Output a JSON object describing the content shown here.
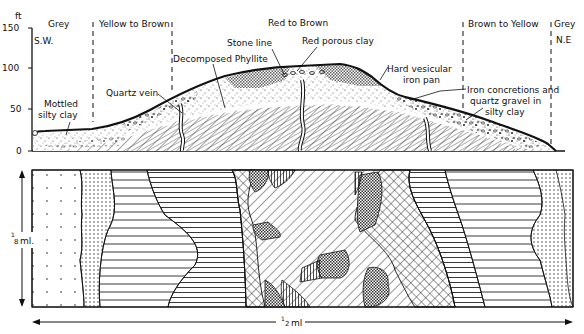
{
  "profile": {
    "y_axis": {
      "unit": "ft",
      "ticks": [
        "150",
        "100",
        "50",
        "0"
      ]
    },
    "zones": [
      {
        "label": "Grey"
      },
      {
        "label": "Yellow to Brown"
      },
      {
        "label": "Red to Brown"
      },
      {
        "label": "Brown to Yellow"
      },
      {
        "label": "Grey"
      }
    ],
    "directions": {
      "left": "S.W.",
      "right": "N.E"
    },
    "annotations": {
      "mottled_1": "Mottled",
      "mottled_2": "silty clay",
      "quartz_vein": "Quartz vein",
      "decomposed_phyllite": "Decomposed Phyllite",
      "stone_line": "Stone line",
      "red_porous_clay": "Red porous clay",
      "iron_pan_1": "Hard vesicular",
      "iron_pan_2": "iron pan",
      "iron_conc_1": "Iron concretions and",
      "iron_conc_2": "quartz gravel in",
      "iron_conc_3": "silty clay"
    }
  },
  "plan_map": {
    "vertical_scale": "⅓ ml.",
    "vertical_scale_num": "1",
    "vertical_scale_den": "8",
    "vertical_scale_unit": "ml.",
    "horizontal_scale_num": "1",
    "horizontal_scale_den": "2",
    "horizontal_scale_unit": "ml"
  }
}
